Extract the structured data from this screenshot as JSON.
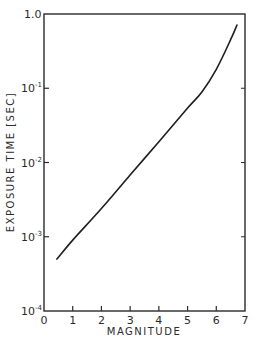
{
  "chart_data": {
    "type": "line",
    "title": "",
    "xlabel": "MAGNITUDE",
    "ylabel": "EXPOSURE TIME [SEC]",
    "xlim": [
      0,
      7
    ],
    "ylim": [
      0.0001,
      1.0
    ],
    "yscale": "log",
    "grid": false,
    "legend": null,
    "x_ticks": [
      "0",
      "1",
      "2",
      "3",
      "4",
      "5",
      "6",
      "7"
    ],
    "y_ticks": [
      {
        "base": "1.0",
        "exp": ""
      },
      {
        "base": "10",
        "exp": "-1"
      },
      {
        "base": "10",
        "exp": "-2"
      },
      {
        "base": "10",
        "exp": "-3"
      },
      {
        "base": "10",
        "exp": "-4"
      }
    ],
    "series": [
      {
        "name": "exposure time",
        "x": [
          0.45,
          1.0,
          2.0,
          3.0,
          4.0,
          5.0,
          5.5,
          6.0,
          6.5,
          6.72
        ],
        "y": [
          0.0005,
          0.0009,
          0.0024,
          0.0068,
          0.019,
          0.054,
          0.089,
          0.18,
          0.45,
          0.71
        ]
      }
    ]
  }
}
